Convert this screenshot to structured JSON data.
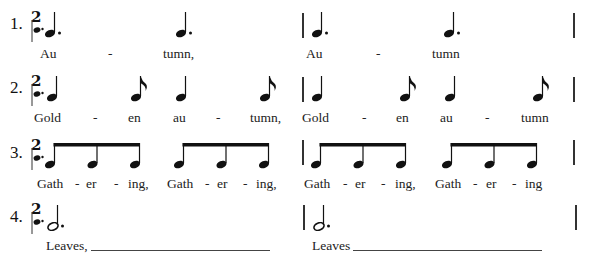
{
  "exercise": {
    "time_signature": {
      "top": "2",
      "bottom": "dotted-quarter-icon"
    },
    "rows": [
      {
        "number": "1.",
        "rhythm": [
          "dotted-quarter",
          "dotted-quarter",
          "dotted-quarter",
          "dotted-quarter"
        ],
        "lyrics": [
          "Au",
          "-",
          "tumn,",
          "Au",
          "-",
          "tumn"
        ]
      },
      {
        "number": "2.",
        "rhythm": [
          "quarter",
          "eighth",
          "quarter",
          "eighth",
          "quarter",
          "eighth",
          "quarter",
          "eighth"
        ],
        "lyrics": [
          "Gold",
          "-",
          "en",
          "au",
          "-",
          "tumn,",
          "Gold",
          "-",
          "en",
          "au",
          "-",
          "tumn"
        ]
      },
      {
        "number": "3.",
        "rhythm": [
          "beamed-eighths-3",
          "beamed-eighths-3",
          "beamed-eighths-3",
          "beamed-eighths-3"
        ],
        "lyrics": [
          "Gath",
          "-",
          "er",
          "-",
          "ing,",
          "Gath",
          "-",
          "er",
          "-",
          "ing,",
          "Gath",
          "-",
          "er",
          "-",
          "ing,",
          "Gath",
          "-",
          "er",
          "-",
          "ing"
        ]
      },
      {
        "number": "4.",
        "rhythm": [
          "dotted-half",
          "dotted-half"
        ],
        "lyrics": [
          "Leaves,",
          "Leaves"
        ]
      }
    ]
  }
}
